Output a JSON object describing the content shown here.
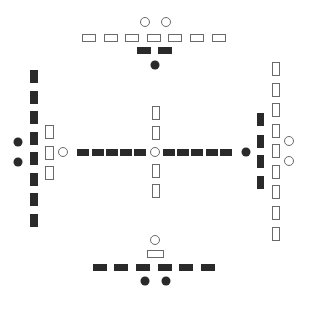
{
  "diagram": {
    "title": "",
    "colors": {
      "background": "#ffffff",
      "yin_fill": "#2a2a2a",
      "yang_stroke": "#6a6a6a",
      "yang_fill": "#ffffff"
    },
    "groups": [
      {
        "name": "south-top",
        "white_circles": [
          [
            145,
            22
          ],
          [
            166,
            22
          ]
        ],
        "white_rects": [
          [
            82,
            34,
            13,
            7
          ],
          [
            104,
            34,
            13,
            7
          ],
          [
            125,
            34,
            13,
            7
          ],
          [
            147,
            34,
            13,
            7
          ],
          [
            168,
            34,
            13,
            7
          ],
          [
            190,
            34,
            13,
            7
          ],
          [
            212,
            34,
            13,
            7
          ]
        ],
        "black_rects": [
          [
            137,
            47,
            14,
            7
          ],
          [
            158,
            47,
            14,
            7
          ]
        ],
        "black_dots": [
          [
            155,
            65
          ]
        ]
      },
      {
        "name": "north-bottom",
        "white_circles": [
          [
            155,
            240
          ]
        ],
        "white_rects": [
          [
            147,
            250,
            16,
            7
          ]
        ],
        "black_rects": [
          [
            93,
            264,
            14,
            7
          ],
          [
            114,
            264,
            14,
            7
          ],
          [
            136,
            264,
            14,
            7
          ],
          [
            158,
            264,
            14,
            7
          ],
          [
            179,
            264,
            14,
            7
          ],
          [
            201,
            264,
            14,
            7
          ]
        ],
        "black_dots": [
          [
            145,
            281
          ],
          [
            166,
            281
          ]
        ]
      },
      {
        "name": "east-left",
        "white_circles": [
          [
            63,
            152
          ]
        ],
        "white_rects": [
          [
            45,
            125,
            8,
            13
          ],
          [
            45,
            146,
            8,
            13
          ],
          [
            45,
            166,
            8,
            13
          ]
        ],
        "black_rects": [
          [
            30,
            70,
            8,
            13
          ],
          [
            30,
            91,
            8,
            13
          ],
          [
            30,
            111,
            8,
            13
          ],
          [
            30,
            132,
            8,
            13
          ],
          [
            30,
            152,
            8,
            13
          ],
          [
            30,
            173,
            8,
            13
          ],
          [
            30,
            193,
            8,
            13
          ],
          [
            30,
            214,
            8,
            13
          ]
        ],
        "black_dots": [
          [
            18,
            142
          ],
          [
            18,
            162
          ]
        ]
      },
      {
        "name": "west-right",
        "white_circles": [
          [
            289,
            141
          ],
          [
            289,
            161
          ]
        ],
        "white_rects": [
          [
            272,
            62,
            7,
            13
          ],
          [
            272,
            83,
            7,
            13
          ],
          [
            272,
            103,
            7,
            13
          ],
          [
            272,
            124,
            7,
            13
          ],
          [
            272,
            144,
            7,
            13
          ],
          [
            272,
            165,
            7,
            13
          ],
          [
            272,
            185,
            7,
            13
          ],
          [
            272,
            206,
            7,
            13
          ],
          [
            272,
            227,
            7,
            13
          ]
        ],
        "black_rects": [
          [
            257,
            113,
            7,
            13
          ],
          [
            257,
            135,
            7,
            13
          ],
          [
            257,
            155,
            7,
            13
          ],
          [
            257,
            176,
            7,
            13
          ]
        ],
        "black_dots": [
          [
            246,
            152
          ]
        ]
      },
      {
        "name": "center",
        "white_circles": [
          [
            155,
            152
          ]
        ],
        "white_rects": [
          [
            152,
            106,
            7,
            13
          ],
          [
            152,
            126,
            7,
            13
          ],
          [
            152,
            164,
            7,
            13
          ],
          [
            152,
            184,
            7,
            13
          ]
        ],
        "black_rects": [
          [
            77,
            149,
            12,
            7
          ],
          [
            92,
            149,
            12,
            7
          ],
          [
            106,
            149,
            12,
            7
          ],
          [
            120,
            149,
            12,
            7
          ],
          [
            134,
            149,
            12,
            7
          ],
          [
            163,
            149,
            12,
            7
          ],
          [
            177,
            149,
            12,
            7
          ],
          [
            191,
            149,
            12,
            7
          ],
          [
            206,
            149,
            12,
            7
          ],
          [
            220,
            149,
            12,
            7
          ]
        ],
        "black_dots": []
      }
    ]
  }
}
